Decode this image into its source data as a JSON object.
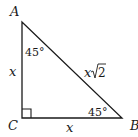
{
  "diagram": {
    "vertices": {
      "A": {
        "label": "A"
      },
      "B": {
        "label": "B"
      },
      "C": {
        "label": "C"
      }
    },
    "angles": {
      "A": "45°",
      "B": "45°",
      "C": "right-angle"
    },
    "sides": {
      "AC": "x",
      "CB": "x",
      "AB_x": "x",
      "AB_sqrt": "2"
    },
    "colors": {
      "stroke": "#1a1a1a",
      "background": "#ffffff"
    }
  }
}
